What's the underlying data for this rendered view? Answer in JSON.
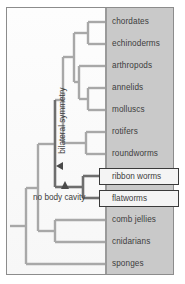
{
  "figure": {
    "colors": {
      "panel_gray": "#c9c9c9",
      "branch_gray": "#a8a8a8",
      "branch_dark": "#6e6e6e",
      "frame_border": "#8c8c8c",
      "text": "#3d3d3d",
      "callout_border": "#3a3a3a"
    }
  },
  "taxa": [
    {
      "name": "chordates",
      "y": 22,
      "highlighted": false
    },
    {
      "name": "echinoderms",
      "y": 44,
      "highlighted": false
    },
    {
      "name": "arthropods",
      "y": 66,
      "highlighted": false
    },
    {
      "name": "annelids",
      "y": 88,
      "highlighted": false
    },
    {
      "name": "molluscs",
      "y": 110,
      "highlighted": false
    },
    {
      "name": "rotifers",
      "y": 132,
      "highlighted": false
    },
    {
      "name": "roundworms",
      "y": 154,
      "highlighted": false
    },
    {
      "name": "ribbon worms",
      "y": 176,
      "highlighted": true
    },
    {
      "name": "flatworms",
      "y": 198,
      "highlighted": true
    },
    {
      "name": "comb jellies",
      "y": 220,
      "highlighted": false
    },
    {
      "name": "cnidarians",
      "y": 242,
      "highlighted": false
    },
    {
      "name": "sponges",
      "y": 264,
      "highlighted": false
    }
  ],
  "annotations": {
    "bilateral_symmetry": {
      "label": "bilateral symmetry",
      "marker": "triangle-left"
    },
    "no_body_cavity": {
      "label": "no body cavity",
      "marker": "triangle-up"
    }
  }
}
